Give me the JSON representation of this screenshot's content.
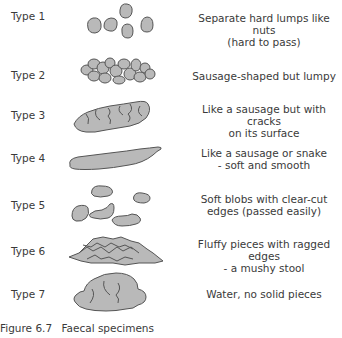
{
  "figure": {
    "caption_number": "Figure 6.7",
    "caption_text": "Faecal specimens",
    "colors": {
      "shape_fill": "#b9b9b9",
      "shape_stroke": "#555555",
      "text": "#3a3a3a"
    },
    "types": [
      {
        "label": "Type 1",
        "icon": "separate-lumps-icon",
        "description_line1": "Separate hard lumps like nuts",
        "description_line2": "(hard to pass)"
      },
      {
        "label": "Type 2",
        "icon": "lumpy-sausage-icon",
        "description_line1": "Sausage-shaped but lumpy",
        "description_line2": ""
      },
      {
        "label": "Type 3",
        "icon": "cracked-sausage-icon",
        "description_line1": "Like a sausage but with cracks",
        "description_line2": "on its surface"
      },
      {
        "label": "Type 4",
        "icon": "smooth-snake-icon",
        "description_line1": "Like a sausage or snake",
        "description_line2": "- soft and smooth"
      },
      {
        "label": "Type 5",
        "icon": "soft-blobs-icon",
        "description_line1": "Soft blobs with clear-cut",
        "description_line2": "edges (passed easily)"
      },
      {
        "label": "Type 6",
        "icon": "fluffy-pieces-icon",
        "description_line1": "Fluffy pieces with ragged edges",
        "description_line2": "- a mushy stool"
      },
      {
        "label": "Type 7",
        "icon": "watery-icon",
        "description_line1": "Water, no solid pieces",
        "description_line2": ""
      }
    ]
  }
}
